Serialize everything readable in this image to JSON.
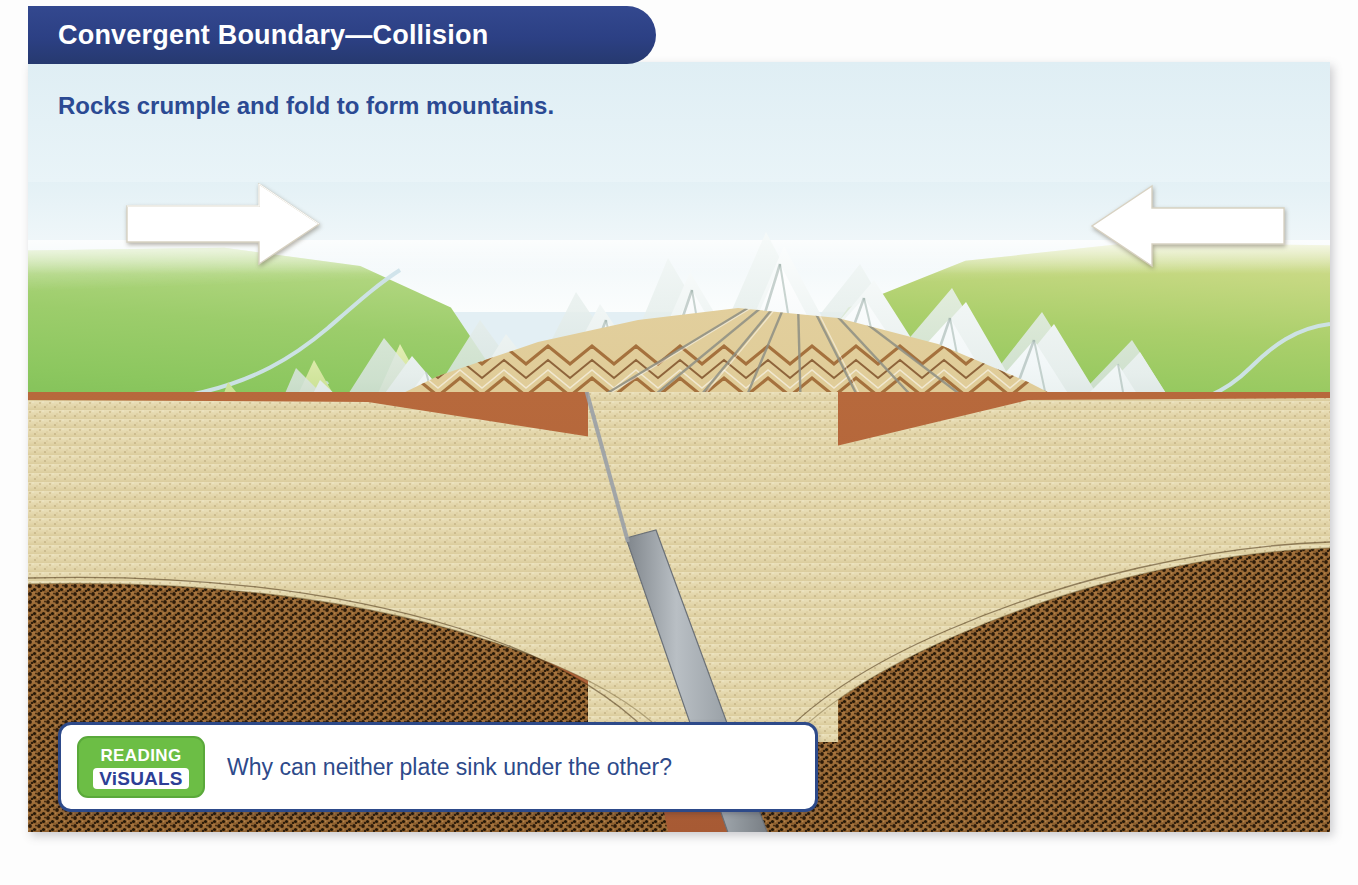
{
  "figure": {
    "title": "Convergent Boundary—Collision",
    "subtitle": "Rocks crumple and fold to form mountains.",
    "type": "geology-cross-section-diagram"
  },
  "callout": {
    "badge_line1": "READING",
    "badge_line2": "ViSUALS",
    "question": "Why can neither plate sink under the other?"
  },
  "scene": {
    "sky_label": "sky",
    "mountains_label": "snow-capped folded mountain range",
    "plain_left_label": "green plain with river",
    "plain_right_label": "green and olive plain with river",
    "folded_strata_label": "crumpled and folded rock layers",
    "magma_label": "igneous intrusion body",
    "arrow_left_label": "plate moving right",
    "arrow_right_label": "plate moving left",
    "slab_label": "downgoing continental slab",
    "layers": [
      {
        "name": "continental crust",
        "color": "#e2d5ab"
      },
      {
        "name": "lithospheric mantle",
        "color": "#9c6a34"
      },
      {
        "name": "asthenosphere",
        "color": "#b0623a"
      }
    ]
  },
  "colors": {
    "title_bar": "#2c4084",
    "title_text": "#ffffff",
    "subtitle_text": "#2b4a93",
    "callout_border": "#2d4a8a",
    "callout_text": "#2d4a8a",
    "badge_green": "#6cbe45",
    "badge_blue_text": "#2d3f96",
    "sky": "#dfeef4",
    "grass": "#8cc75f",
    "crust": "#e2d5ab",
    "mantle": "#9c6a34",
    "asthenosphere": "#b0623a",
    "slab_gray": "#9aa0a6",
    "arrow_white": "#ffffff"
  }
}
